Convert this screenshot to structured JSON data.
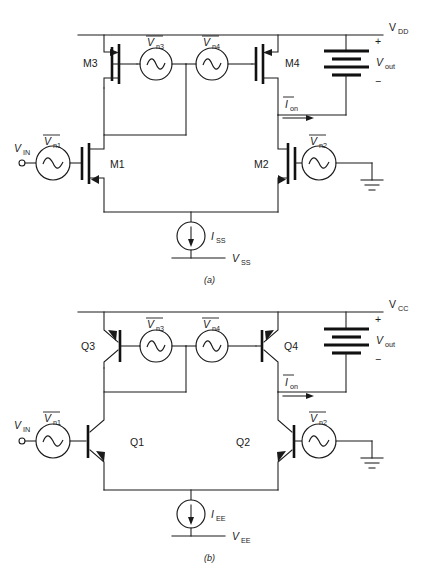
{
  "page": {
    "header_note": "",
    "footer_note": ""
  },
  "figure": {
    "caption_a": "(a)",
    "caption_b": "(b)"
  },
  "circuit_a": {
    "rail_label": "V",
    "rail_sub": "DD",
    "neg_rail_label": "V",
    "neg_rail_sub": "SS",
    "input_label": "V",
    "input_sub": "IN",
    "output_label": "V",
    "output_sub": "out",
    "output_plus": "+",
    "output_minus": "−",
    "current_source_label": "I",
    "current_source_sub": "SS",
    "noise_current_label": "I",
    "noise_current_sub": "on",
    "devices": [
      {
        "name": "M3",
        "type": "pmos"
      },
      {
        "name": "M4",
        "type": "pmos"
      },
      {
        "name": "M1",
        "type": "nmos"
      },
      {
        "name": "M2",
        "type": "nmos"
      }
    ],
    "noise_sources": [
      {
        "label": "V",
        "sub": "n1",
        "name": "vn1"
      },
      {
        "label": "V",
        "sub": "n2",
        "name": "vn2"
      },
      {
        "label": "V",
        "sub": "n3",
        "name": "vn3"
      },
      {
        "label": "V",
        "sub": "n4",
        "name": "vn4"
      }
    ]
  },
  "circuit_b": {
    "rail_label": "V",
    "rail_sub": "CC",
    "neg_rail_label": "V",
    "neg_rail_sub": "EE",
    "input_label": "V",
    "input_sub": "IN",
    "output_label": "V",
    "output_sub": "out",
    "output_plus": "+",
    "output_minus": "−",
    "current_source_label": "I",
    "current_source_sub": "EE",
    "noise_current_label": "I",
    "noise_current_sub": "on",
    "devices": [
      {
        "name": "Q3",
        "type": "pnp"
      },
      {
        "name": "Q4",
        "type": "pnp"
      },
      {
        "name": "Q1",
        "type": "npn"
      },
      {
        "name": "Q2",
        "type": "npn"
      }
    ],
    "noise_sources": [
      {
        "label": "V",
        "sub": "n1",
        "name": "vn1"
      },
      {
        "label": "V",
        "sub": "n2",
        "name": "vn2"
      },
      {
        "label": "V",
        "sub": "n3",
        "name": "vn3"
      },
      {
        "label": "V",
        "sub": "n4",
        "name": "vn4"
      }
    ]
  },
  "icons": {
    "ac_source": "sine-wave-icon",
    "current_source": "arrow-down-icon",
    "ground": "ground-icon",
    "battery": "battery-icon"
  }
}
